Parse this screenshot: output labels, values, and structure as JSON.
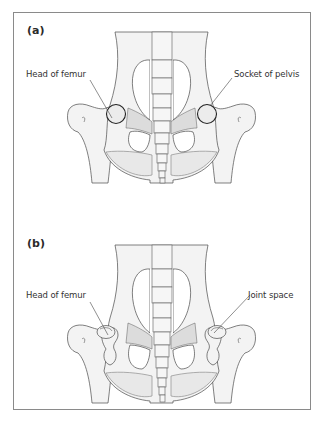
{
  "figure": {
    "border_color": "#8a8a8a",
    "panels": [
      {
        "id": "a",
        "label": "(a)",
        "callouts": [
          {
            "text": "Head of femur",
            "side": "left"
          },
          {
            "text": "Socket of pelvis",
            "side": "right"
          }
        ]
      },
      {
        "id": "b",
        "label": "(b)",
        "callouts": [
          {
            "text": "Head of femur",
            "side": "left"
          },
          {
            "text": "Joint space",
            "side": "right"
          }
        ]
      }
    ]
  }
}
